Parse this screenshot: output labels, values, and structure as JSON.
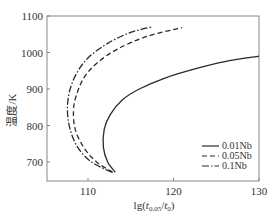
{
  "chart_data": {
    "type": "line",
    "title": "",
    "xlabel": "lg(t0.05/t0)",
    "ylabel": "温度/K",
    "xlim": [
      105,
      130
    ],
    "ylim": [
      650,
      1100
    ],
    "xticks": [
      110,
      120,
      130
    ],
    "yticks": [
      700,
      800,
      900,
      1000,
      1100
    ],
    "grid": false,
    "legend_position": "lower right",
    "series": [
      {
        "name": "0.01Nb",
        "style": "solid",
        "x": [
          113.2,
          112.3,
          111.8,
          111.9,
          112.6,
          114.0,
          116.0,
          119.0,
          122.5,
          126.0,
          130.0
        ],
        "y": [
          672,
          700,
          740,
          790,
          830,
          870,
          900,
          930,
          955,
          975,
          990
        ]
      },
      {
        "name": "0.05Nb",
        "style": "dashed",
        "x": [
          112.9,
          111.0,
          109.5,
          108.5,
          108.3,
          108.6,
          109.5,
          111.0,
          113.5,
          117.0,
          121.0
        ],
        "y": [
          672,
          700,
          740,
          790,
          840,
          880,
          930,
          970,
          1010,
          1045,
          1068
        ]
      },
      {
        "name": "0.1Nb",
        "style": "dashdot",
        "x": [
          112.8,
          110.4,
          108.8,
          107.9,
          107.6,
          107.8,
          108.6,
          110.0,
          112.3,
          115.0,
          117.5
        ],
        "y": [
          672,
          700,
          740,
          790,
          840,
          890,
          940,
          985,
          1025,
          1055,
          1070
        ]
      }
    ]
  },
  "axis": {
    "x_ticks": [
      "110",
      "120",
      "130"
    ],
    "y_ticks": [
      "700",
      "800",
      "900",
      "1000",
      "1100"
    ],
    "xlabel_prefix": "lg(",
    "xlabel_t": "t",
    "xlabel_sub1": "0.05",
    "xlabel_mid": "/",
    "xlabel_sub2": "0",
    "xlabel_suffix": ")",
    "ylabel": "温度/K"
  },
  "legend": [
    {
      "label": "0.01Nb",
      "style": "solid"
    },
    {
      "label": "0.05Nb",
      "style": "dashed"
    },
    {
      "label": "0.1Nb",
      "style": "dashdot"
    }
  ],
  "colors": {
    "line": "#2a2a2a",
    "axis": "#888888"
  }
}
